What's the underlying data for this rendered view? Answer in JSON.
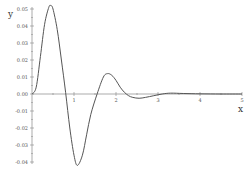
{
  "chart_data": {
    "type": "line",
    "title": "",
    "xlabel": "x",
    "ylabel": "y",
    "xlim": [
      0,
      5
    ],
    "ylim": [
      -0.04,
      0.05
    ],
    "grid": false,
    "x_ticks": [
      "1",
      "2",
      "3",
      "4",
      "5"
    ],
    "y_ticks": [
      "0.05",
      "0.04",
      "0.03",
      "0.02",
      "0.01",
      "0.00",
      "-0.01",
      "-0.02",
      "-0.03",
      "-0.04"
    ],
    "series": [
      {
        "name": "y",
        "color": "#555555",
        "x": [
          0,
          0.1,
          0.2,
          0.3,
          0.4,
          0.45,
          0.5,
          0.6,
          0.7,
          0.8,
          0.9,
          1.0,
          1.08,
          1.2,
          1.3,
          1.4,
          1.55,
          1.7,
          1.8,
          1.9,
          2.0,
          2.1,
          2.2,
          2.3,
          2.4,
          2.55,
          2.7,
          2.9,
          3.1,
          3.3,
          3.6,
          4.0,
          4.5,
          5.0
        ],
        "values": [
          0,
          0.004,
          0.022,
          0.041,
          0.051,
          0.052,
          0.05,
          0.038,
          0.02,
          0.001,
          -0.02,
          -0.036,
          -0.042,
          -0.036,
          -0.024,
          -0.012,
          0,
          0.01,
          0.012,
          0.011,
          0.008,
          0.004,
          0.001,
          -0.001,
          -0.002,
          -0.0025,
          -0.002,
          -0.001,
          0,
          0.0005,
          0.0003,
          0.0001,
          0,
          0
        ]
      }
    ]
  }
}
